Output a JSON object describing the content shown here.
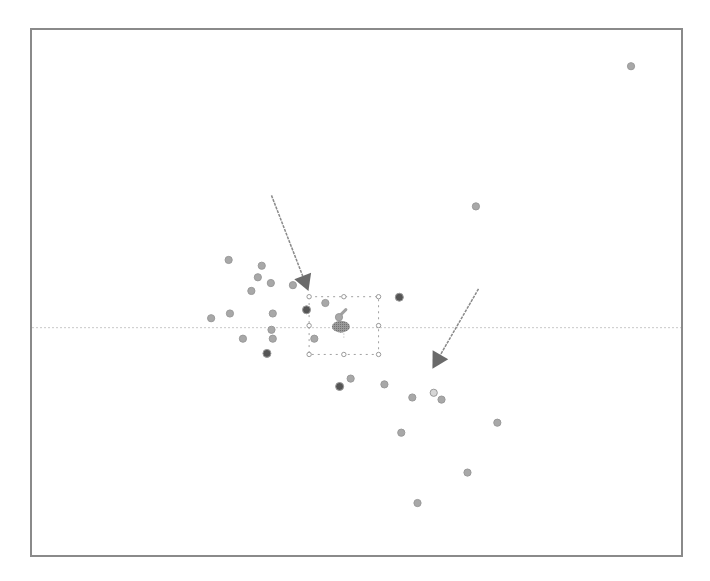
{
  "chart_data": {
    "type": "scatter",
    "title": "",
    "xlabel": "",
    "ylabel": "",
    "xlim": [
      0,
      100
    ],
    "ylim": [
      0,
      100
    ],
    "grid": false,
    "legend": "none",
    "reference_line": {
      "orientation": "horizontal",
      "y": 43.3,
      "color": "#c8c8c8",
      "style": "dotted"
    },
    "point_colors": {
      "normal": "#a8a8a8",
      "dark": "#555555",
      "light": "#d6d6d6"
    },
    "points": [
      {
        "x": 92.3,
        "y": 93.1,
        "shade": "normal"
      },
      {
        "x": 68.4,
        "y": 66.4,
        "shade": "normal"
      },
      {
        "x": 30.3,
        "y": 56.2,
        "shade": "normal"
      },
      {
        "x": 35.4,
        "y": 55.1,
        "shade": "normal"
      },
      {
        "x": 34.8,
        "y": 52.9,
        "shade": "normal"
      },
      {
        "x": 36.8,
        "y": 51.8,
        "shade": "normal"
      },
      {
        "x": 33.8,
        "y": 50.3,
        "shade": "normal"
      },
      {
        "x": 40.2,
        "y": 51.4,
        "shade": "normal"
      },
      {
        "x": 45.2,
        "y": 48.0,
        "shade": "normal"
      },
      {
        "x": 42.3,
        "y": 46.7,
        "shade": "dark"
      },
      {
        "x": 56.6,
        "y": 49.1,
        "shade": "dark"
      },
      {
        "x": 30.5,
        "y": 46.0,
        "shade": "normal"
      },
      {
        "x": 27.6,
        "y": 45.1,
        "shade": "normal"
      },
      {
        "x": 37.1,
        "y": 46.0,
        "shade": "normal"
      },
      {
        "x": 36.9,
        "y": 42.9,
        "shade": "normal"
      },
      {
        "x": 37.1,
        "y": 41.2,
        "shade": "normal"
      },
      {
        "x": 32.5,
        "y": 41.2,
        "shade": "normal"
      },
      {
        "x": 43.5,
        "y": 41.2,
        "shade": "normal"
      },
      {
        "x": 36.2,
        "y": 38.4,
        "shade": "dark"
      },
      {
        "x": 47.3,
        "y": 45.3,
        "shade": "normal"
      },
      {
        "x": 49.1,
        "y": 33.6,
        "shade": "normal"
      },
      {
        "x": 47.4,
        "y": 32.1,
        "shade": "dark"
      },
      {
        "x": 54.3,
        "y": 32.5,
        "shade": "normal"
      },
      {
        "x": 58.6,
        "y": 30.0,
        "shade": "normal"
      },
      {
        "x": 61.9,
        "y": 30.9,
        "shade": "light"
      },
      {
        "x": 63.1,
        "y": 29.6,
        "shade": "normal"
      },
      {
        "x": 56.9,
        "y": 23.3,
        "shade": "normal"
      },
      {
        "x": 71.7,
        "y": 25.2,
        "shade": "normal"
      },
      {
        "x": 67.1,
        "y": 15.7,
        "shade": "normal"
      },
      {
        "x": 59.4,
        "y": 9.9,
        "shade": "normal"
      }
    ],
    "annotations": [
      {
        "type": "arrow",
        "label": "arrow-upper-left",
        "from": [
          36.9,
          68.5
        ],
        "to": [
          42.6,
          50.3
        ]
      },
      {
        "type": "arrow",
        "label": "arrow-lower-right",
        "from": [
          68.8,
          50.7
        ],
        "to": [
          61.7,
          35.5
        ]
      }
    ],
    "selection": {
      "type": "bounding-box",
      "x_range": [
        42.7,
        53.4
      ],
      "y_range": [
        38.2,
        49.2
      ],
      "center_cluster": {
        "x": 47.6,
        "y": 43.5
      }
    }
  }
}
